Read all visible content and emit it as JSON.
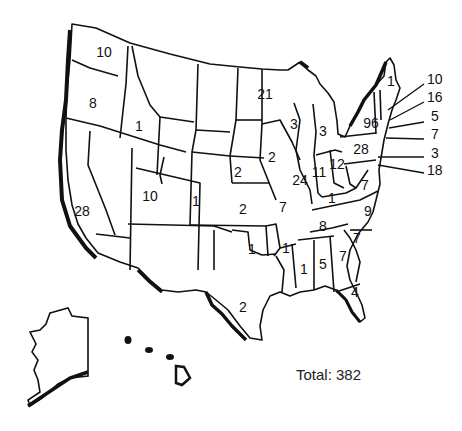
{
  "map": {
    "title": "",
    "total_label": "Total: 382",
    "total_value": 382,
    "states": [
      {
        "state": "Washington",
        "value": "10",
        "x": 104,
        "y": 52
      },
      {
        "state": "Oregon",
        "value": "8",
        "x": 93,
        "y": 103
      },
      {
        "state": "California",
        "value": "28",
        "x": 82,
        "y": 211
      },
      {
        "state": "Idaho",
        "value": "1",
        "x": 139,
        "y": 126
      },
      {
        "state": "Utah",
        "value": "10",
        "x": 150,
        "y": 196
      },
      {
        "state": "Colorado",
        "value": "1",
        "x": 196,
        "y": 201
      },
      {
        "state": "Nebraska",
        "value": "2",
        "x": 238,
        "y": 172
      },
      {
        "state": "Kansas",
        "value": "2",
        "x": 243,
        "y": 209
      },
      {
        "state": "Oklahoma",
        "value": "1",
        "x": 252,
        "y": 249
      },
      {
        "state": "Texas",
        "value": "2",
        "x": 243,
        "y": 307
      },
      {
        "state": "Minnesota",
        "value": "21",
        "x": 265,
        "y": 94
      },
      {
        "state": "Iowa",
        "value": "2",
        "x": 272,
        "y": 157
      },
      {
        "state": "Missouri",
        "value": "7",
        "x": 283,
        "y": 207
      },
      {
        "state": "Arkansas",
        "value": "1",
        "x": 286,
        "y": 248
      },
      {
        "state": "Wisconsin",
        "value": "3",
        "x": 294,
        "y": 124
      },
      {
        "state": "Illinois",
        "value": "24",
        "x": 300,
        "y": 180
      },
      {
        "state": "Michigan",
        "value": "3",
        "x": 323,
        "y": 131
      },
      {
        "state": "Indiana",
        "value": "11",
        "x": 319,
        "y": 172
      },
      {
        "state": "Ohio",
        "value": "12",
        "x": 337,
        "y": 164
      },
      {
        "state": "Kentucky",
        "value": "1",
        "x": 332,
        "y": 198
      },
      {
        "state": "Tennessee",
        "value": "8",
        "x": 323,
        "y": 226
      },
      {
        "state": "Mississippi",
        "value": "1",
        "x": 304,
        "y": 269
      },
      {
        "state": "Alabama",
        "value": "5",
        "x": 323,
        "y": 264
      },
      {
        "state": "Georgia",
        "value": "7",
        "x": 343,
        "y": 256
      },
      {
        "state": "Florida",
        "value": "4",
        "x": 355,
        "y": 292
      },
      {
        "state": "South Carolina",
        "value": "7",
        "x": 357,
        "y": 238
      },
      {
        "state": "North Carolina",
        "value": "9",
        "x": 368,
        "y": 211
      },
      {
        "state": "Virginia",
        "value": "7",
        "x": 365,
        "y": 185
      },
      {
        "state": "Pennsylvania",
        "value": "28",
        "x": 361,
        "y": 149
      },
      {
        "state": "New York",
        "value": "96",
        "x": 371,
        "y": 123
      },
      {
        "state": "Maine",
        "value": "1",
        "x": 391,
        "y": 81
      }
    ],
    "callouts": [
      {
        "state": "New Hampshire",
        "value": "10",
        "x": 427,
        "y": 79
      },
      {
        "state": "Massachusetts",
        "value": "16",
        "x": 427,
        "y": 97
      },
      {
        "state": "Rhode Island",
        "value": "5",
        "x": 427,
        "y": 116
      },
      {
        "state": "Connecticut",
        "value": "7",
        "x": 427,
        "y": 134
      },
      {
        "state": "Delaware",
        "value": "3",
        "x": 427,
        "y": 153
      },
      {
        "state": "Maryland",
        "value": "18",
        "x": 427,
        "y": 170
      }
    ]
  }
}
